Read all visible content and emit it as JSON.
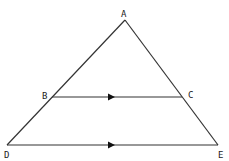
{
  "diagram": {
    "type": "triangle-with-parallel-line",
    "points": {
      "A": {
        "label": "A",
        "x": 125,
        "y": 20
      },
      "B": {
        "label": "B",
        "x": 52,
        "y": 97
      },
      "C": {
        "label": "C",
        "x": 182,
        "y": 97
      },
      "D": {
        "label": "D",
        "x": 7,
        "y": 145
      },
      "E": {
        "label": "E",
        "x": 218,
        "y": 145
      }
    },
    "segments": [
      "AD",
      "AE",
      "BC",
      "DE"
    ],
    "parallel_marks": [
      "BC",
      "DE"
    ],
    "line_color": "#333333"
  }
}
